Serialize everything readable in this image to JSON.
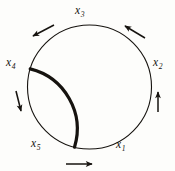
{
  "figure": {
    "type": "diagram",
    "background_color": "#fdfdfb",
    "stroke_color": "#16130f",
    "canvas": {
      "width": 175,
      "height": 171
    }
  },
  "circle": {
    "center_x": 89.5,
    "center_y": 87,
    "radius": 62,
    "stroke_width": 1.1,
    "bold_arc": {
      "start_angle_deg": 163,
      "end_angle_deg": 256,
      "stroke_width": 3.2
    }
  },
  "labels": [
    {
      "id": "x1",
      "base": "x",
      "sub": "1",
      "text": "x1",
      "position": "bottom-right"
    },
    {
      "id": "x2",
      "base": "x",
      "sub": "2",
      "text": "x2",
      "position": "right"
    },
    {
      "id": "x3",
      "base": "x",
      "sub": "3",
      "text": "x3",
      "position": "top"
    },
    {
      "id": "x4",
      "base": "x",
      "sub": "4",
      "text": "x4",
      "position": "left"
    },
    {
      "id": "x5",
      "base": "x",
      "sub": "5",
      "text": "x5",
      "position": "bottom-left"
    }
  ],
  "arrows": [
    {
      "id": "arrow-upper-left",
      "direction": "down-left",
      "x1": 54,
      "y1": 25,
      "x2": 33,
      "y2": 36
    },
    {
      "id": "arrow-upper-right",
      "direction": "up-left",
      "x1": 145,
      "y1": 38,
      "x2": 125,
      "y2": 26
    },
    {
      "id": "arrow-right",
      "direction": "up",
      "x1": 158,
      "y1": 112,
      "x2": 158,
      "y2": 92
    },
    {
      "id": "arrow-left",
      "direction": "down",
      "x1": 16,
      "y1": 91,
      "x2": 21,
      "y2": 111
    },
    {
      "id": "arrow-bottom",
      "direction": "right",
      "x1": 66,
      "y1": 164,
      "x2": 92,
      "y2": 164
    }
  ]
}
